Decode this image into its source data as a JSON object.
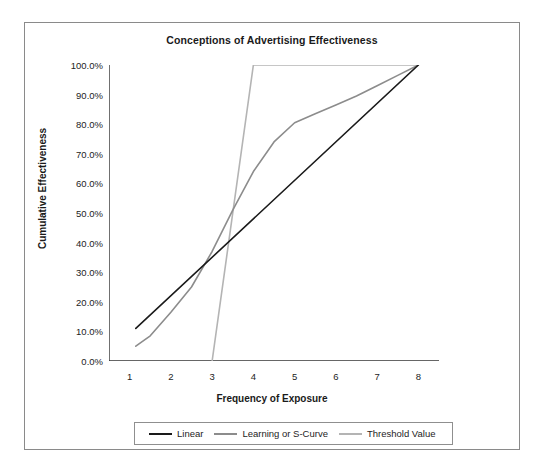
{
  "chart_data": {
    "type": "line",
    "title": "Conceptions of Advertising Effectiveness",
    "xlabel": "Frequency of Exposure",
    "ylabel": "Cumulative Effectiveness",
    "xlim": [
      0.5,
      8.5
    ],
    "ylim": [
      0,
      100
    ],
    "grid": false,
    "legend_position": "bottom",
    "x_tick_labels": [
      "1",
      "2",
      "3",
      "4",
      "5",
      "6",
      "7",
      "8"
    ],
    "x_ticks": [
      1,
      2,
      3,
      4,
      5,
      6,
      7,
      8
    ],
    "y_tick_labels": [
      "0.0%",
      "10.0%",
      "20.0%",
      "30.0%",
      "40.0%",
      "50.0%",
      "60.0%",
      "70.0%",
      "80.0%",
      "90.0%",
      "100.0%"
    ],
    "y_ticks": [
      0,
      10,
      20,
      30,
      40,
      50,
      60,
      70,
      80,
      90,
      100
    ],
    "series": [
      {
        "name": "Linear",
        "color": "#1a1a1a",
        "x": [
          1.15,
          8.0
        ],
        "values": [
          11.0,
          100.0
        ]
      },
      {
        "name": "Learning or S-Curve",
        "color": "#8c8c8c",
        "x": [
          1.15,
          1.5,
          2.0,
          2.5,
          3.0,
          3.5,
          4.0,
          4.5,
          5.0,
          5.5,
          6.0,
          6.5,
          7.0,
          7.5,
          8.0
        ],
        "values": [
          5.0,
          8.5,
          16.5,
          25.0,
          37.0,
          51.0,
          64.0,
          74.0,
          80.5,
          83.5,
          86.5,
          89.5,
          93.0,
          96.5,
          100.0
        ]
      },
      {
        "name": "Threshold Value",
        "color": "#b4b4b4",
        "x": [
          3.0,
          4.0,
          8.0
        ],
        "values": [
          0.0,
          100.0,
          100.0
        ]
      }
    ]
  },
  "frame": {
    "border_color": "#8a8a8a",
    "background": "#ffffff"
  },
  "axis": {
    "line_color": "#333333"
  }
}
